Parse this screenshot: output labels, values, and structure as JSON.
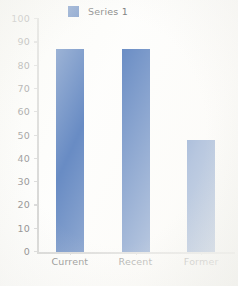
{
  "chart_data": {
    "type": "bar",
    "title": "",
    "subtitle": "",
    "xlabel": "",
    "ylabel": "",
    "categories": [
      "Current",
      "Recent",
      "Former"
    ],
    "series": [
      {
        "name": "Series 1",
        "color": "#3665b0",
        "values": [
          87,
          87,
          48
        ]
      }
    ],
    "ylim": [
      0,
      100
    ],
    "ytick_interval": 10,
    "yticks": [
      0,
      10,
      20,
      30,
      40,
      50,
      60,
      70,
      80,
      90,
      100
    ],
    "ytick_labels": [
      "0",
      "10",
      "20",
      "30",
      "40",
      "50",
      "60",
      "70",
      "80",
      "90",
      "100"
    ],
    "grid": false,
    "legend": {
      "visible": true,
      "position": "top-center",
      "entries": [
        {
          "label": "Series 1",
          "marker": "square-swatch",
          "color": "#3665b0"
        }
      ]
    },
    "axis_line_color": "#c9c9c7",
    "background_color": "#fdfdfb",
    "tick_label_color": "#585858"
  }
}
